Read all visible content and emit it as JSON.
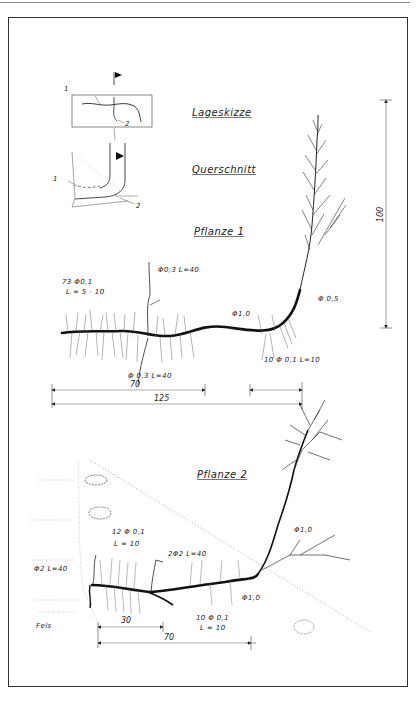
{
  "figure": {
    "sketch_labels": {
      "site_sketch": "Lageskizze",
      "cross_section": "Querschnitt",
      "marker_1": "1",
      "marker_2": "2",
      "marker_1b": "1",
      "marker_2b": "2"
    },
    "plant1": {
      "title": "Pflanze 1",
      "annotations": {
        "lateral_roots": "73 Φ0,1",
        "lateral_length": "L = 5 - 10",
        "upper_branch": "Φ0,3 L=40",
        "lower_branch": "Φ 0,3 L=40",
        "main_root": "Φ1,0",
        "stem": "Φ 0,5",
        "right_roots": "10 Φ 0,1  L=10"
      },
      "dimensions": {
        "height": "100",
        "span_short": "70",
        "span_long": "125"
      }
    },
    "plant2": {
      "title": "Pflanze 2",
      "annotations": {
        "lateral_roots": "12 Φ 0,1",
        "lateral_length": "L = 10",
        "branch": "2Φ2 L=40",
        "left_branch": "Φ2 L=40",
        "stem": "Φ1,0",
        "main_root": "Φ1,0",
        "right_roots": "10 Φ 0,1",
        "right_length": "L = 10",
        "rock": "Fels"
      },
      "dimensions": {
        "span_short": "30",
        "span_long": "70"
      }
    }
  }
}
